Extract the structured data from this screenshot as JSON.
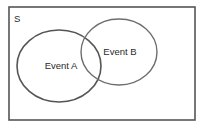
{
  "diagram": {
    "type": "venn",
    "universe": {
      "label": "S",
      "x": 9,
      "y": 7,
      "width": 186,
      "height": 113,
      "stroke": "#555555"
    },
    "sets": [
      {
        "id": "A",
        "label": "Event A",
        "cx": 59,
        "cy": 66,
        "rx": 42,
        "ry": 36,
        "stroke": "#555555",
        "label_x": 61,
        "label_y": 69
      },
      {
        "id": "B",
        "label": "Event B",
        "cx": 119,
        "cy": 52,
        "rx": 38,
        "ry": 33,
        "stroke": "#6e6e6e",
        "label_x": 120,
        "label_y": 55
      }
    ]
  }
}
